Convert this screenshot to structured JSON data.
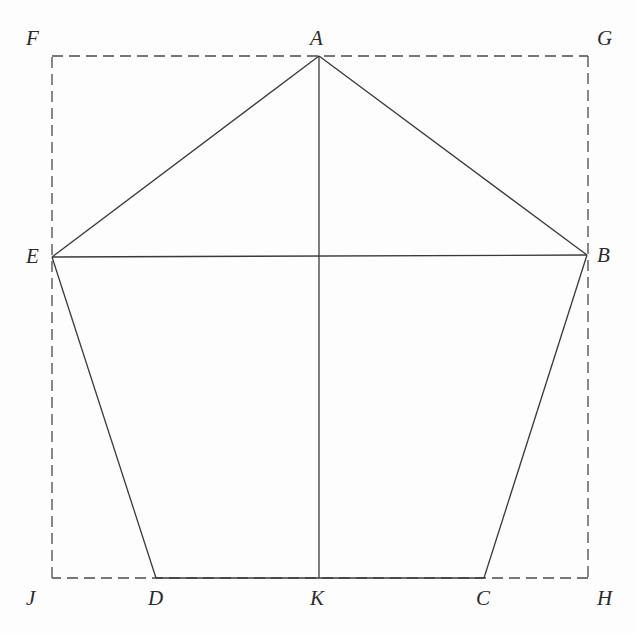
{
  "figure": {
    "type": "geometry-diagram",
    "canvas": {
      "width": 636,
      "height": 633,
      "background": "#fdfdfd"
    },
    "style": {
      "solid_stroke": "#3a3a3a",
      "dashed_stroke": "#4a4a4a",
      "label_color": "#2b2b2b",
      "stroke_width": 1.3,
      "dash_pattern": "11 6"
    },
    "points": [
      {
        "id": "A",
        "label": "A",
        "x": 319,
        "y": 56,
        "label_x": 310,
        "label_y": 28,
        "role": "pentagon-apex"
      },
      {
        "id": "B",
        "label": "B",
        "x": 587,
        "y": 255,
        "label_x": 597,
        "label_y": 245,
        "role": "pentagon-vertex"
      },
      {
        "id": "C",
        "label": "C",
        "x": 484,
        "y": 578,
        "label_x": 476,
        "label_y": 588,
        "role": "pentagon-vertex"
      },
      {
        "id": "D",
        "label": "D",
        "x": 156,
        "y": 578,
        "label_x": 148,
        "label_y": 588,
        "role": "pentagon-vertex"
      },
      {
        "id": "E",
        "label": "E",
        "x": 52,
        "y": 257,
        "label_x": 26,
        "label_y": 246,
        "role": "pentagon-vertex"
      },
      {
        "id": "F",
        "label": "F",
        "x": 52,
        "y": 56,
        "label_x": 26,
        "label_y": 28,
        "role": "rectangle-corner"
      },
      {
        "id": "G",
        "label": "G",
        "x": 588,
        "y": 56,
        "label_x": 597,
        "label_y": 28,
        "role": "rectangle-corner"
      },
      {
        "id": "H",
        "label": "H",
        "x": 588,
        "y": 578,
        "label_x": 597,
        "label_y": 588,
        "role": "rectangle-corner"
      },
      {
        "id": "J",
        "label": "J",
        "x": 52,
        "y": 578,
        "label_x": 26,
        "label_y": 588,
        "role": "rectangle-corner"
      },
      {
        "id": "K",
        "label": "K",
        "x": 319,
        "y": 578,
        "label_x": 310,
        "label_y": 588,
        "role": "foot-of-altitude"
      }
    ],
    "solid_segments": [
      {
        "id": "AB",
        "from": "A",
        "to": "B",
        "x1": 319,
        "y1": 56,
        "x2": 587,
        "y2": 255
      },
      {
        "id": "BC",
        "from": "B",
        "to": "C",
        "x1": 587,
        "y1": 255,
        "x2": 484,
        "y2": 578
      },
      {
        "id": "CD",
        "from": "C",
        "to": "D",
        "x1": 484,
        "y1": 578,
        "x2": 156,
        "y2": 578
      },
      {
        "id": "DE",
        "from": "D",
        "to": "E",
        "x1": 156,
        "y1": 578,
        "x2": 52,
        "y2": 257
      },
      {
        "id": "EA",
        "from": "E",
        "to": "A",
        "x1": 52,
        "y1": 257,
        "x2": 319,
        "y2": 56
      },
      {
        "id": "EB",
        "from": "E",
        "to": "B",
        "x1": 52,
        "y1": 257,
        "x2": 587,
        "y2": 255
      },
      {
        "id": "AK",
        "from": "A",
        "to": "K",
        "x1": 319,
        "y1": 56,
        "x2": 319,
        "y2": 578
      }
    ],
    "dashed_segments": [
      {
        "id": "FG",
        "from": "F",
        "to": "G",
        "x1": 52,
        "y1": 56,
        "x2": 588,
        "y2": 56
      },
      {
        "id": "GH",
        "from": "G",
        "to": "H",
        "x1": 588,
        "y1": 56,
        "x2": 588,
        "y2": 578
      },
      {
        "id": "HJ",
        "from": "H",
        "to": "J",
        "x1": 588,
        "y1": 578,
        "x2": 52,
        "y2": 578
      },
      {
        "id": "JF",
        "from": "J",
        "to": "F",
        "x1": 52,
        "y1": 578,
        "x2": 52,
        "y2": 56
      }
    ]
  }
}
